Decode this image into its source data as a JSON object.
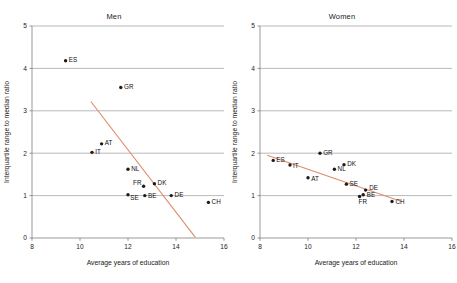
{
  "chart_data": [
    {
      "type": "scatter",
      "title": "Men",
      "xlabel": "Average years of education",
      "ylabel": "Interquartile range to median ratio",
      "xlim": [
        8,
        16
      ],
      "ylim": [
        0,
        5
      ],
      "xticks": [
        8,
        10,
        12,
        14,
        16
      ],
      "yticks": [
        0,
        1,
        2,
        3,
        4,
        5
      ],
      "grid": true,
      "legend": "none",
      "points": [
        {
          "label": "ES",
          "x": 9.4,
          "y": 4.18
        },
        {
          "label": "GR",
          "x": 11.7,
          "y": 3.55
        },
        {
          "label": "AT",
          "x": 10.9,
          "y": 2.22
        },
        {
          "label": "IT",
          "x": 10.5,
          "y": 2.02
        },
        {
          "label": "NL",
          "x": 12.0,
          "y": 1.62
        },
        {
          "label": "DK",
          "x": 13.1,
          "y": 1.28
        },
        {
          "label": "FR",
          "x": 12.65,
          "y": 1.22
        },
        {
          "label": "SE",
          "x": 12.0,
          "y": 1.02
        },
        {
          "label": "BE",
          "x": 12.7,
          "y": 1.0
        },
        {
          "label": "DE",
          "x": 13.8,
          "y": 1.0
        },
        {
          "label": "CH",
          "x": 15.35,
          "y": 0.84
        }
      ],
      "trendline": {
        "x0": 10.45,
        "y0": 3.22,
        "x1": 14.8,
        "y1": 0.02
      }
    },
    {
      "type": "scatter",
      "title": "Women",
      "xlabel": "Average years of education",
      "ylabel": "Interquartile range to median ratio",
      "xlim": [
        8,
        16
      ],
      "ylim": [
        0,
        5
      ],
      "xticks": [
        8,
        10,
        12,
        14,
        16
      ],
      "yticks": [
        0,
        1,
        2,
        3,
        4,
        5
      ],
      "grid": true,
      "legend": "none",
      "points": [
        {
          "label": "ES",
          "x": 8.55,
          "y": 1.83
        },
        {
          "label": "IT",
          "x": 9.25,
          "y": 1.72
        },
        {
          "label": "GR",
          "x": 10.5,
          "y": 2.0
        },
        {
          "label": "AT",
          "x": 10.0,
          "y": 1.42
        },
        {
          "label": "NL",
          "x": 11.1,
          "y": 1.62
        },
        {
          "label": "DK",
          "x": 11.5,
          "y": 1.73
        },
        {
          "label": "SE",
          "x": 11.6,
          "y": 1.27
        },
        {
          "label": "DE",
          "x": 12.4,
          "y": 1.13
        },
        {
          "label": "BE",
          "x": 12.3,
          "y": 1.02
        },
        {
          "label": "FR",
          "x": 12.15,
          "y": 0.98
        },
        {
          "label": "CH",
          "x": 13.5,
          "y": 0.86
        }
      ],
      "trendline": {
        "x0": 8.3,
        "y0": 1.95,
        "x1": 13.9,
        "y1": 0.86
      }
    }
  ],
  "colors": {
    "trendline": "#e08b6a",
    "marker": "#1b1b1b",
    "grid": "#8a8a8a",
    "axis": "#6e6e6e",
    "text": "#1a1a1a",
    "background": "#ffffff"
  }
}
